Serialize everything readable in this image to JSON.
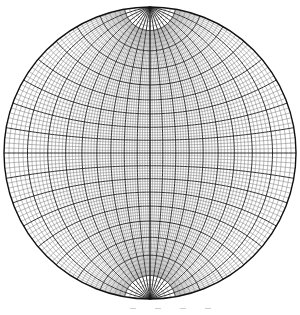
{
  "diagram": {
    "type": "wulff-net",
    "title": "",
    "center": [
      150,
      153
    ],
    "radius": 146,
    "minor_step_deg": 2,
    "major_step_deg": 10,
    "colors": {
      "background": "#ffffff",
      "minor_line": "#6a6a6a",
      "major_line": "#1a1a1a",
      "outline": "#111111"
    },
    "labels": []
  }
}
